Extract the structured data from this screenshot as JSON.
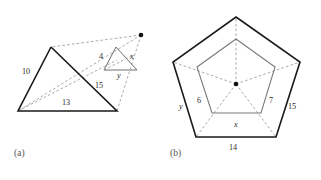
{
  "figure": {
    "background_color": "#ffffff",
    "stroke_color": "#1a1a1a",
    "inner_stroke_color": "#7a7a7a",
    "dashed_stroke_color": "#8c8c8c"
  },
  "panel_a": {
    "caption": "(a)",
    "description": "Two similar triangles in homothetic position with dashed projection lines meeting at a center point",
    "large_triangle": {
      "labels": {
        "left_side": "10",
        "bottom_side": "13",
        "hypotenuse": "15"
      }
    },
    "small_triangle": {
      "labels": {
        "left_side": "4",
        "right_side": "x",
        "bottom_side": "y"
      }
    }
  },
  "panel_b": {
    "caption": "(b)",
    "description": "Two concentric similar pentagons sharing a center with dashed radial spokes",
    "outer_pentagon": {
      "labels": {
        "bottom_side": "14",
        "right_side": "15",
        "left_side": "y"
      }
    },
    "inner_pentagon": {
      "labels": {
        "bottom_side": "x",
        "left_side": "6",
        "right_side": "7"
      }
    }
  }
}
